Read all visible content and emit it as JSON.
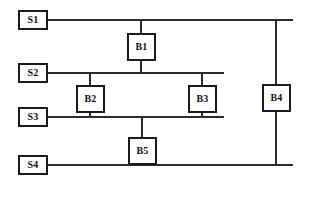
{
  "diagram": {
    "type": "single-line-bus-tie-diagram",
    "stroke_color": "#2b2b2b",
    "border_color": "#1a1a1a",
    "background_color": "#ffffff",
    "sources": [
      {
        "id": "S1",
        "label": "S1",
        "x": 18,
        "y": 10,
        "bus_y": 20,
        "bus_x1": 48,
        "bus_x2": 293
      },
      {
        "id": "S2",
        "label": "S2",
        "x": 18,
        "y": 63,
        "bus_y": 73,
        "bus_x1": 48,
        "bus_x2": 224
      },
      {
        "id": "S3",
        "label": "S3",
        "x": 18,
        "y": 107,
        "bus_y": 117,
        "bus_x1": 48,
        "bus_x2": 224
      },
      {
        "id": "S4",
        "label": "S4",
        "x": 18,
        "y": 155,
        "bus_y": 165,
        "bus_x1": 48,
        "bus_x2": 293
      }
    ],
    "breakers": [
      {
        "id": "B1",
        "label": "B1",
        "x": 127,
        "y": 33,
        "tie_x": 141,
        "tie_y1": 20,
        "tie_y2": 73
      },
      {
        "id": "B2",
        "label": "B2",
        "x": 76,
        "y": 85,
        "tie_x": 90,
        "tie_y1": 73,
        "tie_y2": 117
      },
      {
        "id": "B3",
        "label": "B3",
        "x": 188,
        "y": 85,
        "tie_x": 202,
        "tie_y1": 73,
        "tie_y2": 117
      },
      {
        "id": "B4",
        "label": "B4",
        "x": 262,
        "y": 84,
        "tie_x": 276,
        "tie_y1": 20,
        "tie_y2": 165
      },
      {
        "id": "B5",
        "label": "B5",
        "x": 128,
        "y": 137,
        "tie_x": 142,
        "tie_y1": 117,
        "tie_y2": 165
      }
    ]
  }
}
